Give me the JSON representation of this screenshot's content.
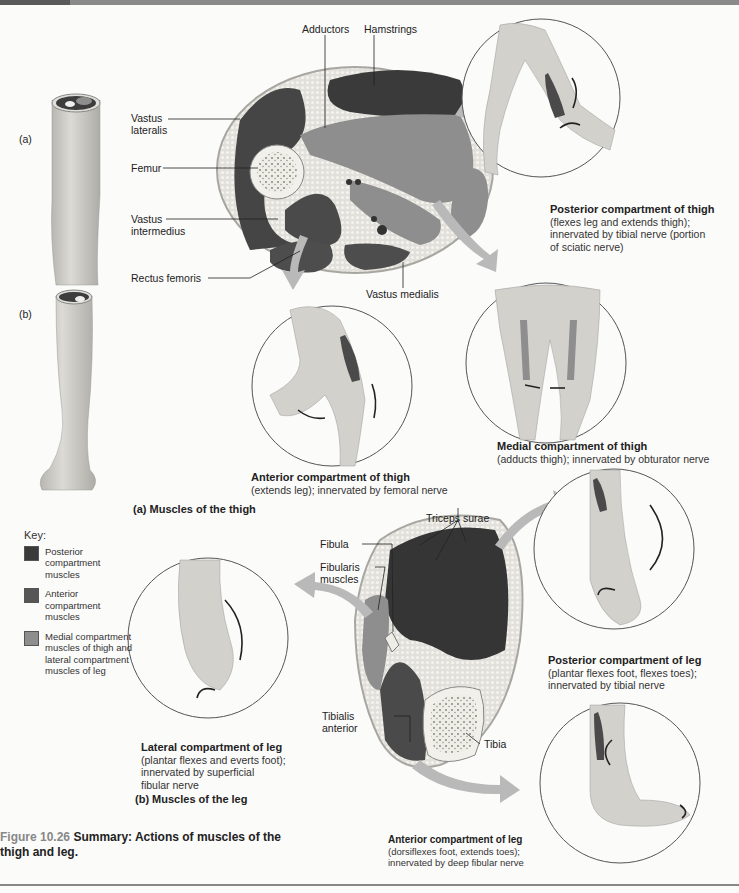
{
  "figure": {
    "number": "Figure 10.26",
    "title": "Summary: Actions of muscles of the thigh and leg."
  },
  "panel_labels": {
    "a": "(a)",
    "b": "(b)"
  },
  "sections": {
    "thigh": "(a) Muscles of the thigh",
    "leg": "(b) Muscles of the leg"
  },
  "thigh_cross_section": {
    "labels": {
      "adductors": "Adductors",
      "hamstrings": "Hamstrings",
      "vastus_lateralis_1": "Vastus",
      "vastus_lateralis_2": "lateralis",
      "femur": "Femur",
      "vastus_intermedius_1": "Vastus",
      "vastus_intermedius_2": "intermedius",
      "rectus_femoris": "Rectus femoris",
      "vastus_medialis": "Vastus medialis"
    }
  },
  "leg_cross_section": {
    "labels": {
      "triceps_surae": "Triceps surae",
      "fibula": "Fibula",
      "fibularis_1": "Fibularis",
      "fibularis_2": "muscles",
      "tibialis_1": "Tibialis",
      "tibialis_2": "anterior",
      "tibia": "Tibia"
    }
  },
  "compartments": {
    "posterior_thigh": {
      "title": "Posterior compartment of thigh",
      "line1": "(flexes leg and extends thigh);",
      "line2": "innervated by tibial nerve (portion",
      "line3": "of sciatic nerve)"
    },
    "medial_thigh": {
      "title": "Medial compartment of thigh",
      "line1": "(adducts thigh); innervated by obturator nerve"
    },
    "anterior_thigh": {
      "title": "Anterior compartment of thigh",
      "line1": "(extends leg); innervated by femoral nerve"
    },
    "posterior_leg": {
      "title": "Posterior compartment of leg",
      "line1": "(plantar flexes foot, flexes toes);",
      "line2": "innervated by tibial nerve"
    },
    "lateral_leg": {
      "title": "Lateral compartment of leg",
      "line1": "(plantar flexes and everts foot);",
      "line2": "innervated by superficial",
      "line3": "fibular nerve"
    },
    "anterior_leg": {
      "title": "Anterior compartment of leg",
      "line1": "(dorsiflexes foot, extends toes);",
      "line2": "innervated by deep fibular nerve"
    }
  },
  "key": {
    "title": "Key:",
    "items": [
      {
        "label": "Posterior compartment muscles",
        "color": "#3a3a3a"
      },
      {
        "label": "Anterior compartment muscles",
        "color": "#565656"
      },
      {
        "label": "Medial compartment muscles of thigh and lateral compartment muscles of leg",
        "color": "#8e8e8e"
      }
    ]
  },
  "colors": {
    "posterior": "#3a3a3a",
    "anterior": "#565656",
    "medial_lateral": "#8e8e8e",
    "fat": "#dedcd6",
    "skin": "#d6d4cf",
    "arrow": "#b9b9b9"
  }
}
